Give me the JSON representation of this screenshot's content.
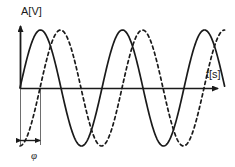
{
  "figure": {
    "title": "",
    "background_color": "#ffffff",
    "line_color": "#1a1a1a",
    "guide_color": "#6e6e6e"
  },
  "labels": {
    "y_axis": "A[V]",
    "x_axis": "t[s]",
    "phase_symbol": "φ"
  },
  "chart_data": {
    "type": "line",
    "title": "",
    "xlabel": "t[s]",
    "ylabel": "A[V]",
    "grid": false,
    "legend": false,
    "axis_style": "arrowed-axes-origin-at-left",
    "x_range_px": [
      20,
      225
    ],
    "y_center_px": 88,
    "amplitude_px": 58,
    "period_px": 82,
    "phase_shift_px": 20,
    "annotations": [
      {
        "name": "phase-bracket",
        "label": "φ",
        "from_x_px": 20,
        "to_x_px": 40,
        "arrow_y_px": 140,
        "description": "double-headed arrow marking the phase difference between the two waves"
      }
    ],
    "series": [
      {
        "name": "reference-sine",
        "style": "solid",
        "color": "#1a1a1a",
        "amplitude": 1.0,
        "period": 82,
        "phase_deg": 0,
        "cycles": 2.5,
        "equation": "A = sin(2*pi*t/T)"
      },
      {
        "name": "shifted-sine",
        "style": "dashed",
        "color": "#1a1a1a",
        "amplitude": 1.0,
        "period": 82,
        "phase_deg": -87.8,
        "cycles": 2.5,
        "equation": "A = sin(2*pi*t/T - phi)"
      }
    ]
  }
}
